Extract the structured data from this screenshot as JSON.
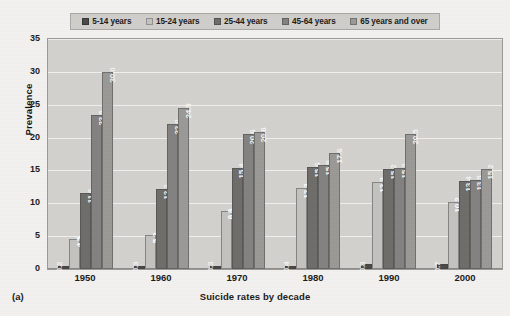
{
  "chart_data": {
    "type": "bar",
    "title": "",
    "xlabel": "Suicide rates by decade",
    "ylabel": "Prevalence",
    "ylim": [
      0,
      35
    ],
    "yticks": [
      0,
      5,
      10,
      15,
      20,
      25,
      30,
      35
    ],
    "grid": true,
    "legend_position": "top",
    "panel_label": "(a)",
    "categories": [
      "1950",
      "1960",
      "1970",
      "1980",
      "1990",
      "2000"
    ],
    "series": [
      {
        "name": "5-14 years",
        "color": "#4a4a4a",
        "values": [
          0.2,
          0.3,
          0.3,
          0.4,
          0.8,
          0.7
        ]
      },
      {
        "name": "15-24 years",
        "color": "#c3c2bf",
        "values": [
          4.5,
          5.2,
          8.8,
          12.3,
          13.2,
          10.2
        ]
      },
      {
        "name": "25-44 years",
        "color": "#6e6d6a",
        "values": [
          11.6,
          12.2,
          15.4,
          15.6,
          15.2,
          13.4
        ]
      },
      {
        "name": "45-64 years",
        "color": "#838281",
        "values": [
          23.5,
          22.0,
          20.6,
          15.9,
          15.3,
          13.5
        ]
      },
      {
        "name": "65 years and over",
        "color": "#9a9996",
        "values": [
          30.0,
          24.5,
          20.8,
          17.6,
          20.5,
          15.2
        ]
      }
    ],
    "value_labels": [
      [
        "0.2",
        "4.5",
        "11.6",
        "23.5",
        "30.0"
      ],
      [
        "0.3",
        "5.2",
        "12.2",
        "22.0",
        "24.5"
      ],
      [
        "0.3",
        "8.8",
        "15.4",
        "20.6",
        "20.8"
      ],
      [
        "0.4",
        "12.3",
        "15.6",
        "15.9",
        "17.6"
      ],
      [
        "0.8",
        "13.2",
        "15.2",
        "15.3",
        "20.5"
      ],
      [
        "0.7",
        "10.2",
        "13.4",
        "13.5",
        "15.2"
      ]
    ]
  },
  "colors": {
    "page_background": "#f2f1ef",
    "plot_background": "#d2d1ce",
    "gridline": "#f0efed",
    "legend_background": "#cfcecb",
    "axis": "#8d8c89",
    "text": "#1b1b1b"
  }
}
